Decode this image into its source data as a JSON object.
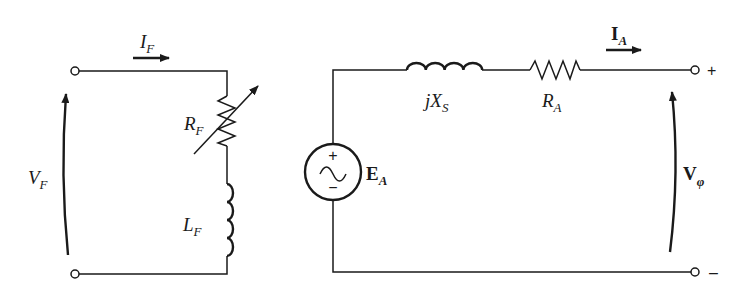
{
  "diagram": {
    "type": "equivalent circuit",
    "field_circuit": {
      "current_label": "I",
      "current_sub": "F",
      "voltage_label": "V",
      "voltage_sub": "F",
      "resistor_label": "R",
      "resistor_sub": "F",
      "inductor_label": "L",
      "inductor_sub": "F"
    },
    "armature_circuit": {
      "source_label": "E",
      "source_sub": "A",
      "source_plus": "+",
      "source_minus": "−",
      "reactance_prefix": "jX",
      "reactance_sub": "S",
      "resistor_label": "R",
      "resistor_sub": "A",
      "current_label": "I",
      "current_sub": "A",
      "output_voltage_label": "V",
      "output_voltage_sub": "φ",
      "terminal_plus": "+",
      "terminal_minus": "–"
    }
  }
}
